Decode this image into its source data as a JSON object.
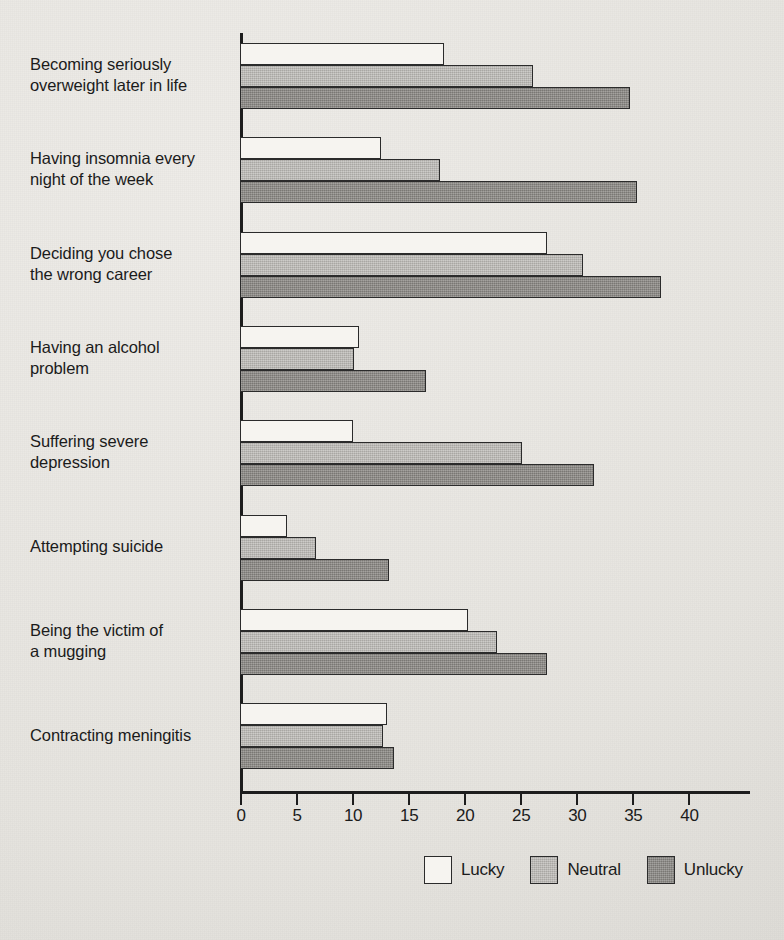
{
  "chart_data": {
    "type": "bar",
    "orientation": "horizontal",
    "title": "",
    "subtitle": "",
    "xlabel": "",
    "ylabel": "",
    "xlim": [
      0,
      43
    ],
    "xticks": [
      0,
      5,
      10,
      15,
      20,
      25,
      30,
      35,
      40
    ],
    "xtick_labels": [
      "0",
      "5",
      "10",
      "15",
      "20",
      "25",
      "30",
      "35",
      "40"
    ],
    "grid": false,
    "legend_position": "bottom-right",
    "categories": [
      "Becoming seriously\noverweight later in life",
      "Having insomnia every\nnight of the week",
      "Deciding you chose\nthe wrong career",
      "Having an alcohol\nproblem",
      "Suffering severe\ndepression",
      "Attempting suicide",
      "Being the victim of\na mugging",
      "Contracting meningitis"
    ],
    "series": [
      {
        "name": "Lucky",
        "color": "#f6f4f0",
        "values": [
          18.2,
          12.6,
          27.4,
          10.6,
          10.1,
          4.2,
          20.3,
          13.1
        ]
      },
      {
        "name": "Neutral",
        "color": "#b9b7b3",
        "values": [
          26.1,
          17.8,
          30.6,
          10.2,
          25.2,
          6.8,
          22.9,
          12.8
        ]
      },
      {
        "name": "Unlucky",
        "color": "#8b8985",
        "values": [
          34.8,
          35.4,
          37.6,
          16.6,
          31.6,
          13.3,
          27.4,
          13.7
        ]
      }
    ]
  },
  "legend": {
    "items": [
      {
        "label": "Lucky"
      },
      {
        "label": "Neutral"
      },
      {
        "label": "Unlucky"
      }
    ]
  },
  "colors": {
    "background": "#e9e7e3",
    "axis": "#1d1d1d",
    "text": "#1b1b1b",
    "lucky": "#f6f4f0",
    "neutral": "#b9b7b3",
    "unlucky": "#8b8985"
  }
}
